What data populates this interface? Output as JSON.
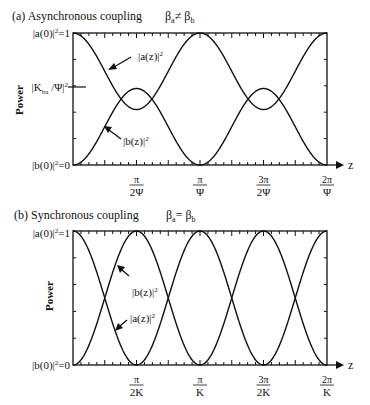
{
  "chart_data": [
    {
      "type": "line",
      "panel": "a",
      "title": "(a) Asynchronous coupling",
      "condition": "βa≠ βb",
      "xlabel": "z",
      "ylabel": "Power",
      "y_tick_labels": {
        "top": "|a(0)|²=1",
        "mid": "|Kba /Ψ|²",
        "bottom": "|b(0)|²=0"
      },
      "x_tick_labels": [
        {
          "num": "π",
          "den": "2Ψ",
          "x": 0.25
        },
        {
          "num": "π",
          "den": "Ψ",
          "x": 0.5
        },
        {
          "num": "3π",
          "den": "2Ψ",
          "x": 0.75
        },
        {
          "num": "2π",
          "den": "Ψ",
          "x": 1.0
        }
      ],
      "x_range_label": [
        0,
        "2π/Ψ"
      ],
      "ylim": [
        0,
        1
      ],
      "mid_level": 0.58,
      "series": [
        {
          "name": "|a(z)|²",
          "formula": "1 - (K/Ψ)² sin²(Ψz)",
          "min": 0.42,
          "max": 1
        },
        {
          "name": "|b(z)|²",
          "formula": "(K/Ψ)² sin²(Ψz)",
          "min": 0,
          "max": 0.58
        }
      ],
      "annotations": [
        "|a(z)|²",
        "|b(z)|²"
      ]
    },
    {
      "type": "line",
      "panel": "b",
      "title": "(b) Synchronous coupling",
      "condition": "βa= βb",
      "xlabel": "z",
      "ylabel": "Power",
      "y_tick_labels": {
        "top": "|a(0)|²=1",
        "bottom": "|b(0)|²=0"
      },
      "x_tick_labels": [
        {
          "num": "π",
          "den": "2K",
          "x": 0.25
        },
        {
          "num": "π",
          "den": "K",
          "x": 0.5
        },
        {
          "num": "3π",
          "den": "2K",
          "x": 0.75
        },
        {
          "num": "2π",
          "den": "K",
          "x": 1.0
        }
      ],
      "ylim": [
        0,
        1
      ],
      "series": [
        {
          "name": "|a(z)|²",
          "formula": "cos²(Kz)",
          "min": 0,
          "max": 1
        },
        {
          "name": "|b(z)|²",
          "formula": "sin²(Kz)",
          "min": 0,
          "max": 1
        }
      ],
      "annotations": [
        "|b(z)|²",
        "|a(z)|²"
      ]
    }
  ],
  "labels": {
    "a_title": "(a) Asynchronous coupling",
    "a_cond": "βa≠ βb",
    "b_title": "(b) Synchronous coupling",
    "b_cond": "βa= βb",
    "power": "Power",
    "z": "z"
  }
}
